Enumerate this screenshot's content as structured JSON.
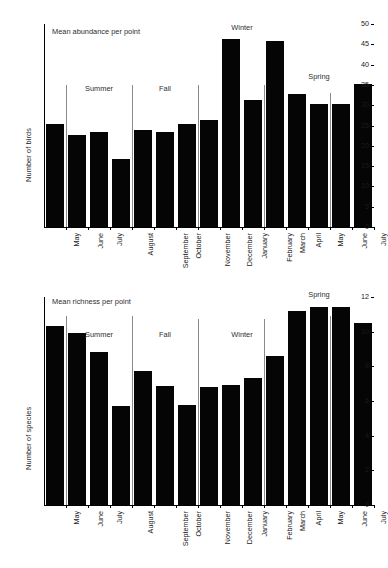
{
  "figure": {
    "background": "#ffffff",
    "bar_color": "#050505",
    "separator_color": "#8a8a8a",
    "axis_color": "#000000"
  },
  "chart_data": [
    {
      "type": "bar",
      "panel": "top",
      "title": "",
      "annotation": "Mean abundance per point",
      "xlabel": "",
      "ylabel": "Number of birds",
      "ylim": [
        0,
        50
      ],
      "yticks": [
        0,
        5,
        10,
        15,
        20,
        25,
        30,
        35,
        40,
        45,
        50
      ],
      "ytick_labels": [
        "0",
        "5",
        "10",
        "15",
        "20",
        "25",
        "30",
        "35",
        "40",
        "45",
        "50"
      ],
      "grid": false,
      "legend": "none",
      "categories": [
        "May",
        "June",
        "July",
        "August",
        "September",
        "October",
        "November",
        "December",
        "January",
        "February",
        "March",
        "April",
        "May",
        "June",
        "July"
      ],
      "values": [
        25.4,
        22.7,
        23.3,
        16.7,
        24.0,
        23.5,
        25.4,
        26.3,
        46.3,
        31.4,
        45.7,
        32.7,
        30.2,
        30.4,
        35.2
      ],
      "season_labels": [
        "Summer",
        "Fall",
        "Winter",
        "Spring"
      ],
      "season_label_positions": [
        2.0,
        5.0,
        8.5,
        12.0
      ],
      "season_label_values": [
        33,
        33,
        48,
        36
      ],
      "separators": [
        {
          "after_index": 0,
          "top_value": 35
        },
        {
          "after_index": 3,
          "top_value": 35
        },
        {
          "after_index": 6,
          "top_value": 35
        },
        {
          "after_index": 9,
          "top_value": 35
        },
        {
          "after_index": 12,
          "top_value": 33
        }
      ]
    },
    {
      "type": "bar",
      "panel": "bottom",
      "title": "",
      "annotation": "Mean richness per point",
      "xlabel": "",
      "ylabel": "Number of species",
      "ylim": [
        0,
        12
      ],
      "yticks": [
        0,
        2,
        4,
        6,
        8,
        10,
        12
      ],
      "ytick_labels": [
        "0",
        "2",
        "4",
        "6",
        "8",
        "10",
        "12"
      ],
      "grid": false,
      "legend": "none",
      "categories": [
        "May",
        "June",
        "July",
        "August",
        "September",
        "October",
        "November",
        "December",
        "January",
        "February",
        "March",
        "April",
        "May",
        "June",
        "July"
      ],
      "values": [
        10.35,
        9.95,
        8.85,
        5.7,
        7.75,
        6.85,
        5.75,
        6.8,
        6.95,
        7.35,
        8.6,
        11.2,
        11.4,
        11.45,
        10.5
      ],
      "season_labels": [
        "Summer",
        "Fall",
        "Winter",
        "Spring"
      ],
      "season_label_positions": [
        2.0,
        5.0,
        8.5,
        12.0
      ],
      "season_label_values": [
        9.6,
        9.6,
        9.6,
        11.9
      ],
      "separators": [
        {
          "after_index": 0,
          "top_value": 10.9
        },
        {
          "after_index": 3,
          "top_value": 10.9
        },
        {
          "after_index": 6,
          "top_value": 10.75
        },
        {
          "after_index": 9,
          "top_value": 10.75
        },
        {
          "after_index": 12,
          "top_value": 10.9
        }
      ]
    }
  ]
}
